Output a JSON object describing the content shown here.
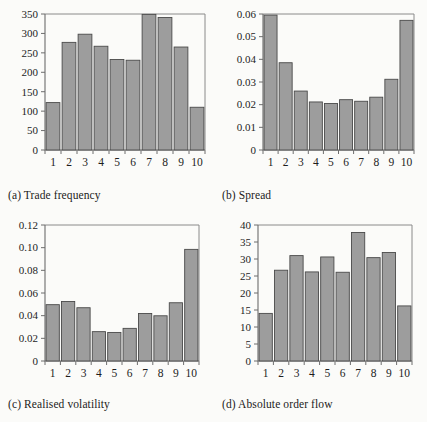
{
  "figure": {
    "panel_count": 4
  },
  "chart_data": [
    {
      "type": "bar",
      "panel": "a",
      "title": "(a) Trade frequency",
      "categories": [
        "1",
        "2",
        "3",
        "4",
        "5",
        "6",
        "7",
        "8",
        "9",
        "10"
      ],
      "values": [
        122,
        277,
        298,
        267,
        233,
        231,
        349,
        341,
        265,
        110
      ],
      "xlabel": "",
      "ylabel": "",
      "ylim": [
        0,
        350
      ],
      "yticks": [
        0,
        50,
        100,
        150,
        200,
        250,
        300,
        350
      ],
      "ytick_labels": [
        "0",
        "50",
        "100",
        "150",
        "200",
        "250",
        "300",
        "350"
      ],
      "grid": false,
      "legend": "none",
      "bar_color": "#9d9d9d",
      "bar_edge_color": "#4a4a4a"
    },
    {
      "type": "bar",
      "panel": "b",
      "title": "(b) Spread",
      "categories": [
        "1",
        "2",
        "3",
        "4",
        "5",
        "6",
        "7",
        "8",
        "9",
        "10"
      ],
      "values": [
        0.0595,
        0.0385,
        0.026,
        0.0212,
        0.0205,
        0.0222,
        0.0215,
        0.0233,
        0.0312,
        0.0572
      ],
      "xlabel": "",
      "ylabel": "",
      "ylim": [
        0,
        0.06
      ],
      "yticks": [
        0,
        0.01,
        0.02,
        0.03,
        0.04,
        0.05,
        0.06
      ],
      "ytick_labels": [
        "0",
        "0.01",
        "0.02",
        "0.03",
        "0.04",
        "0.05",
        "0.06"
      ],
      "grid": false,
      "legend": "none",
      "bar_color": "#9d9d9d",
      "bar_edge_color": "#4a4a4a"
    },
    {
      "type": "bar",
      "panel": "c",
      "title": "(c) Realised volatility",
      "categories": [
        "1",
        "2",
        "3",
        "4",
        "5",
        "6",
        "7",
        "8",
        "9",
        "10"
      ],
      "values": [
        0.0497,
        0.0525,
        0.047,
        0.0259,
        0.0252,
        0.0288,
        0.0419,
        0.0399,
        0.0514,
        0.0985
      ],
      "xlabel": "",
      "ylabel": "",
      "ylim": [
        0,
        0.12
      ],
      "yticks": [
        0,
        0.02,
        0.04,
        0.06,
        0.08,
        0.1,
        0.12
      ],
      "ytick_labels": [
        "0",
        "0.02",
        "0.04",
        "0.06",
        "0.08",
        "0.10",
        "0.12"
      ],
      "grid": false,
      "legend": "none",
      "bar_color": "#9d9d9d",
      "bar_edge_color": "#4a4a4a"
    },
    {
      "type": "bar",
      "panel": "d",
      "title": "(d) Absolute order flow",
      "categories": [
        "1",
        "2",
        "3",
        "4",
        "5",
        "6",
        "7",
        "8",
        "9",
        "10"
      ],
      "values": [
        14.0,
        26.7,
        31.0,
        26.2,
        30.6,
        26.1,
        37.8,
        30.4,
        31.9,
        16.2
      ],
      "xlabel": "",
      "ylabel": "",
      "ylim": [
        0,
        40
      ],
      "yticks": [
        0,
        5,
        10,
        15,
        20,
        25,
        30,
        35,
        40
      ],
      "ytick_labels": [
        "0",
        "5",
        "10",
        "15",
        "20",
        "25",
        "30",
        "35",
        "40"
      ],
      "grid": false,
      "legend": "none",
      "bar_color": "#9d9d9d",
      "bar_edge_color": "#4a4a4a"
    }
  ]
}
